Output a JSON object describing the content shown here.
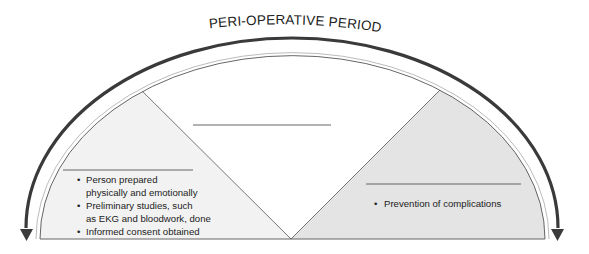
{
  "diagram": {
    "title": "PERI-OPERATIVE PERIOD",
    "colors": {
      "arrow": "#3a3a3a",
      "outline": "#555555",
      "left_fill": "#f2f2f2",
      "right_fill": "#e4e4e4",
      "center_fill": "#ffffff",
      "text": "#222222"
    },
    "phases": [
      {
        "position": "left",
        "heading": "",
        "bullets": [
          {
            "line1": "Person prepared",
            "line2": "physically and emotionally"
          },
          {
            "line1": "Preliminary studies, such",
            "line2": "as EKG and bloodwork, done"
          },
          {
            "line1": "Informed consent obtained",
            "line2": ""
          }
        ]
      },
      {
        "position": "center",
        "heading": "",
        "bullets": []
      },
      {
        "position": "right",
        "heading": "",
        "bullets": [
          {
            "line1": "Prevention of complications",
            "line2": ""
          }
        ]
      }
    ],
    "bullet_glyph": "•"
  }
}
